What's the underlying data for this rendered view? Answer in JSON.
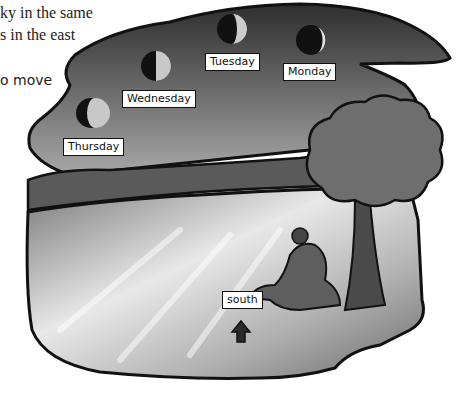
{
  "text_fragments": [
    "ky in the same",
    "s in the east",
    "o move"
  ],
  "moon_labels": {
    "monday": "Monday",
    "tuesday": "Tuesday",
    "wednesday": "Wednesday",
    "thursday": "Thursday"
  },
  "direction_label": "south",
  "icons": {
    "arrow": "up-arrow-icon"
  },
  "colors": {
    "sky_dark": "#3a3a3a",
    "sky_mid": "#8a8a8a",
    "ground_light": "#d8d8d8",
    "outline": "#111111"
  }
}
